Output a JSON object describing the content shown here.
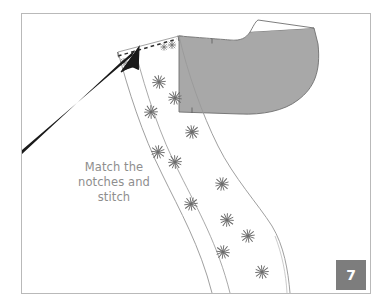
{
  "figure": {
    "caption_text": "Match the\nnotches and\nstitch",
    "page_number": "7",
    "colors": {
      "frame_border": "#b9b9b9",
      "facing_fill": "#a8a8a8",
      "facing_stroke": "#6f6f6f",
      "garment_stroke": "#9a9a9a",
      "stitch_dash": "#3a3a3a",
      "arrow": "#1a1a1a",
      "pin_mark": "#6b6b6b",
      "text": "#8e8e8e",
      "badge_bg": "#7d7d7d",
      "badge_text": "#ffffff",
      "page_bg": "#ffffff"
    },
    "elements": {
      "facing_piece_label": "neckline-facing",
      "garment_piece_label": "bodice-front",
      "stitch_line_label": "shoulder-stitch-line",
      "arrow_label": "pointer-arrow",
      "pin_marks_count": 16
    },
    "pin_marks": [
      {
        "x": 152,
        "y": 76
      },
      {
        "x": 168,
        "y": 90
      },
      {
        "x": 144,
        "y": 106
      },
      {
        "x": 186,
        "y": 127
      },
      {
        "x": 152,
        "y": 148
      },
      {
        "x": 168,
        "y": 160
      },
      {
        "x": 219,
        "y": 182
      },
      {
        "x": 186,
        "y": 201
      },
      {
        "x": 224,
        "y": 221
      },
      {
        "x": 245,
        "y": 236
      },
      {
        "x": 220,
        "y": 253
      },
      {
        "x": 261,
        "y": 275
      },
      {
        "x": 118,
        "y": 44
      },
      {
        "x": 155,
        "y": 41
      },
      {
        "x": 148,
        "y": 40
      },
      {
        "x": 160,
        "y": 38
      }
    ]
  }
}
